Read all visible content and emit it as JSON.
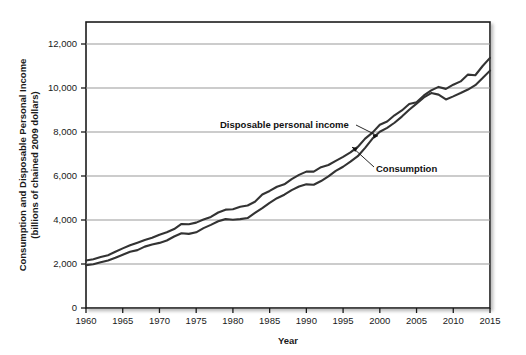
{
  "chart_data": {
    "type": "line",
    "title": "",
    "xlabel": "Year",
    "ylabel_line1": "Consumption and Disposable Personal Income",
    "ylabel_line2": "(billions of chained 2009 dollars)",
    "xlim": [
      1960,
      2015
    ],
    "ylim": [
      0,
      13000
    ],
    "xticks": [
      1960,
      1965,
      1970,
      1975,
      1980,
      1985,
      1990,
      1995,
      2000,
      2005,
      2010,
      2015
    ],
    "xtick_labels": [
      "1960",
      "1965",
      "1970",
      "1975",
      "1980",
      "1985",
      "1990",
      "1995",
      "2000",
      "2005",
      "2010",
      "2015"
    ],
    "yticks": [
      0,
      2000,
      4000,
      6000,
      8000,
      10000,
      12000
    ],
    "ytick_labels": [
      "0",
      "2,000",
      "4,000",
      "6,000",
      "8,000",
      "10,000",
      "12,000"
    ],
    "grid": "horizontal",
    "legend_position": "inline-annotations",
    "line_color": "#333333",
    "grid_color": "#999999",
    "frame_color": "#1a1a1a",
    "x": [
      1960,
      1961,
      1962,
      1963,
      1964,
      1965,
      1966,
      1967,
      1968,
      1969,
      1970,
      1971,
      1972,
      1973,
      1974,
      1975,
      1976,
      1977,
      1978,
      1979,
      1980,
      1981,
      1982,
      1983,
      1984,
      1985,
      1986,
      1987,
      1988,
      1989,
      1990,
      1991,
      1992,
      1993,
      1994,
      1995,
      1996,
      1997,
      1998,
      1999,
      2000,
      2001,
      2002,
      2003,
      2004,
      2005,
      2006,
      2007,
      2008,
      2009,
      2010,
      2011,
      2012,
      2013,
      2014,
      2015
    ],
    "series": [
      {
        "name": "Disposable personal income",
        "label": "Disposable personal income",
        "values": [
          2160,
          2220,
          2320,
          2400,
          2560,
          2710,
          2850,
          2970,
          3090,
          3190,
          3330,
          3440,
          3590,
          3820,
          3810,
          3880,
          4020,
          4140,
          4340,
          4470,
          4490,
          4600,
          4660,
          4830,
          5160,
          5320,
          5510,
          5620,
          5860,
          6050,
          6200,
          6200,
          6400,
          6500,
          6690,
          6870,
          7070,
          7320,
          7700,
          7970,
          8330,
          8480,
          8760,
          8980,
          9270,
          9350,
          9660,
          9890,
          10050,
          9960,
          10150,
          10300,
          10610,
          10580,
          11000,
          11370
        ],
        "endpoint_value": 12200,
        "start_value": 2160
      },
      {
        "name": "Consumption",
        "label": "Consumption",
        "values": [
          1950,
          1990,
          2080,
          2160,
          2280,
          2420,
          2560,
          2630,
          2790,
          2890,
          2960,
          3070,
          3250,
          3400,
          3370,
          3440,
          3630,
          3780,
          3940,
          4040,
          4010,
          4040,
          4090,
          4320,
          4540,
          4780,
          4990,
          5150,
          5360,
          5520,
          5620,
          5600,
          5770,
          5980,
          6230,
          6420,
          6650,
          6900,
          7280,
          7700,
          8010,
          8190,
          8420,
          8700,
          9010,
          9290,
          9570,
          9770,
          9700,
          9480,
          9620,
          9770,
          9930,
          10130,
          10450,
          10790
        ],
        "endpoint_value": 11100,
        "start_value": 1950
      }
    ]
  }
}
